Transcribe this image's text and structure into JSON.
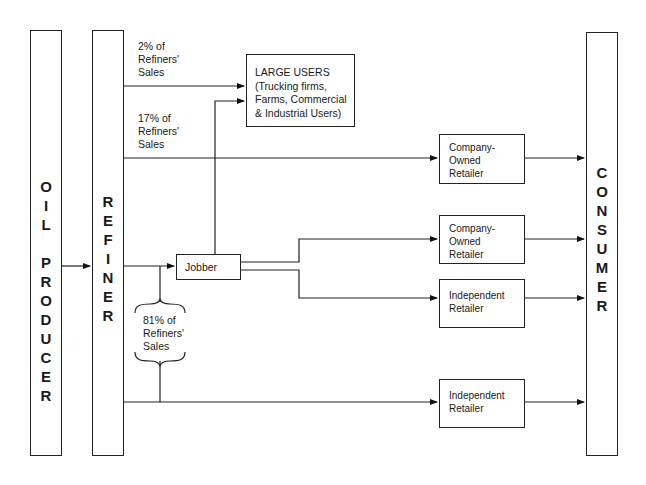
{
  "diagram": {
    "nodes": {
      "oil_producer": {
        "letters": [
          "O",
          "I",
          "L",
          "",
          "P",
          "R",
          "O",
          "D",
          "U",
          "C",
          "E",
          "R"
        ],
        "label": "OIL PRODUCER"
      },
      "refiner": {
        "letters": [
          "R",
          "E",
          "F",
          "I",
          "N",
          "E",
          "R"
        ],
        "label": "REFINER"
      },
      "consumer": {
        "letters": [
          "C",
          "O",
          "N",
          "S",
          "U",
          "M",
          "E",
          "R"
        ],
        "label": "CONSUMER"
      },
      "large_users": {
        "lines": [
          "LARGE USERS",
          "(Trucking firms,",
          "Farms, Commercial",
          "& Industrial Users)"
        ]
      },
      "jobber": {
        "label": "Jobber"
      },
      "company_owned_retailer_1": {
        "lines": [
          "Company-",
          "Owned",
          "Retailer"
        ]
      },
      "company_owned_retailer_2": {
        "lines": [
          "Company-",
          "Owned",
          "Retailer"
        ]
      },
      "independent_retailer_1": {
        "lines": [
          "Independent",
          "Retailer"
        ]
      },
      "independent_retailer_2": {
        "lines": [
          "Independent",
          "Retailer"
        ]
      }
    },
    "flow_labels": {
      "large_users_share": {
        "lines": [
          "2% of",
          "Refiners'",
          "Sales"
        ],
        "value": "2%"
      },
      "company_owned_share": {
        "lines": [
          "17% of",
          "Refiners'",
          "Sales"
        ],
        "value": "17%"
      },
      "jobber_independent_share": {
        "lines": [
          "81% of",
          "Refiners'",
          "Sales"
        ],
        "value": "81%"
      }
    },
    "edges": [
      {
        "from": "Oil Producer",
        "to": "Refiner"
      },
      {
        "from": "Refiner",
        "to": "Large Users",
        "label": "2% of Refiners' Sales"
      },
      {
        "from": "Refiner",
        "to": "Company-Owned Retailer",
        "label": "17% of Refiners' Sales"
      },
      {
        "from": "Refiner",
        "to": "Jobber",
        "label": "81% of Refiners' Sales (group)"
      },
      {
        "from": "Refiner",
        "to": "Independent Retailer (bottom)",
        "label": "81% of Refiners' Sales (group)"
      },
      {
        "from": "Jobber",
        "to": "Large Users"
      },
      {
        "from": "Jobber",
        "to": "Company-Owned Retailer (2nd)"
      },
      {
        "from": "Jobber",
        "to": "Independent Retailer (mid)"
      },
      {
        "from": "Company-Owned Retailer",
        "to": "Consumer"
      },
      {
        "from": "Company-Owned Retailer (2nd)",
        "to": "Consumer"
      },
      {
        "from": "Independent Retailer (mid)",
        "to": "Consumer"
      },
      {
        "from": "Independent Retailer (bottom)",
        "to": "Consumer"
      }
    ]
  }
}
